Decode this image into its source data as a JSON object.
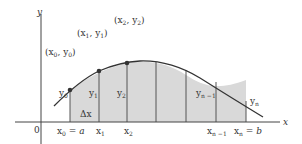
{
  "figure": {
    "type": "trapezoidal-rule-diagram",
    "colors": {
      "fill": "#d9d9d9",
      "curve": "#333333",
      "axis": "#444444",
      "point": "#333333"
    },
    "axes": {
      "x_label": "x",
      "y_label": "y",
      "origin_label": "0"
    },
    "points": [
      {
        "label": "(x",
        "sub": "0",
        "mid": ", y",
        "sub2": "0",
        "end": ")"
      },
      {
        "label": "(x",
        "sub": "1",
        "mid": ", y",
        "sub2": "1",
        "end": ")"
      },
      {
        "label": "(x",
        "sub": "2",
        "mid": ", y",
        "sub2": "2",
        "end": ")"
      }
    ],
    "ordinates": [
      {
        "base": "y",
        "sub": "0"
      },
      {
        "base": "y",
        "sub": "1"
      },
      {
        "base": "y",
        "sub": "2"
      },
      {
        "base": "y",
        "sub": "n −1"
      },
      {
        "base": "y",
        "sub": "n"
      }
    ],
    "abscissae": [
      {
        "base": "x",
        "sub": "0",
        "suffix": " = a"
      },
      {
        "base": "x",
        "sub": "1",
        "suffix": ""
      },
      {
        "base": "x",
        "sub": "2",
        "suffix": ""
      },
      {
        "base": "x",
        "sub": "n −1",
        "suffix": ""
      },
      {
        "base": "x",
        "sub": "n",
        "suffix": " = b"
      }
    ],
    "delta_label": "Δx"
  }
}
